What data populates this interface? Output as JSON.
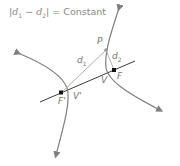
{
  "title": {
    "abs_open": "|",
    "d1": "d",
    "d1_sub": "1",
    "minus": " − ",
    "d2": "d",
    "d2_sub": "2",
    "abs_close": "|",
    "equals_text": " = Constant"
  },
  "labels": {
    "P": "P",
    "d1": "d",
    "d1_sub": "1",
    "d2": "d",
    "d2_sub": "2",
    "F": "F",
    "V": "V",
    "F_prime": "F'",
    "V_prime": "V'"
  },
  "colors": {
    "curve": "#7f7f7f",
    "axis": "#3a3a3a",
    "focus": "#111111",
    "segment": "#b0b0b0",
    "text": "#777777"
  }
}
